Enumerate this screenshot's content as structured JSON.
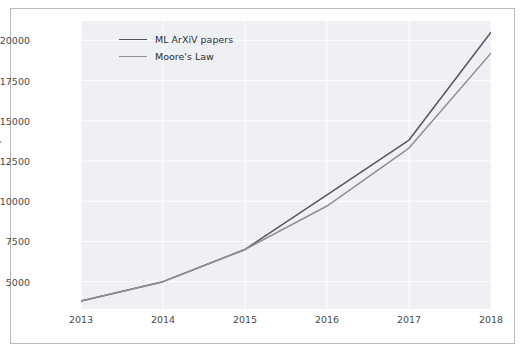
{
  "chart_data": {
    "type": "line",
    "title": "",
    "xlabel": "",
    "ylabel": "Number of Papers",
    "x": [
      2013,
      2014,
      2015,
      2016,
      2017,
      2018
    ],
    "xticks": [
      "2013",
      "2014",
      "2015",
      "2016",
      "2017",
      "2018"
    ],
    "yticks": [
      "5000",
      "7500",
      "10000",
      "12500",
      "15000",
      "17500",
      "20000"
    ],
    "ytick_values": [
      5000,
      7500,
      10000,
      12500,
      15000,
      17500,
      20000
    ],
    "xlim": [
      2013,
      2018
    ],
    "ylim": [
      3300,
      21200
    ],
    "grid": true,
    "legend_position": "upper left",
    "series": [
      {
        "name": "ML ArXiV papers",
        "color": "#55555f",
        "values": [
          3800,
          5000,
          7000,
          10400,
          13800,
          20500
        ]
      },
      {
        "name": "Moore's Law",
        "color": "#8e8e99",
        "values": [
          3800,
          5000,
          7000,
          9700,
          13300,
          19200
        ]
      }
    ]
  },
  "style": {
    "plot_background": "#eff0f4",
    "figure_background": "#ffffff",
    "grid_color": "#ffffff",
    "border_color": "#b9b9c2",
    "tick_text_color": "#4a4a4a"
  }
}
